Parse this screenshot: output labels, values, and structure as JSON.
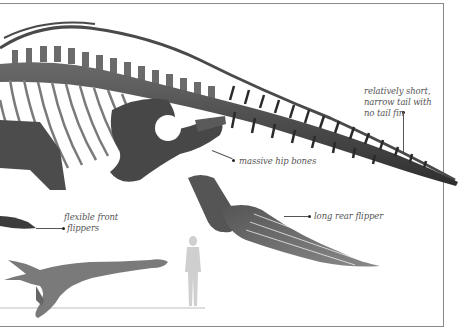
{
  "figure": {
    "colors": {
      "frame": "#8a8a8a",
      "bone_dark": "#3a3a3a",
      "bone_mid": "#5e5e5e",
      "bone_light": "#8c8c8c",
      "silhouette_human": "#cfcfcf",
      "label_text": "#555555"
    }
  },
  "annotations": {
    "tail": {
      "line1": "relatively short,",
      "line2": "narrow tail with",
      "line3": "no tail fin"
    },
    "hip": {
      "text": "massive hip bones"
    },
    "front_flipper": {
      "line1": "flexible front",
      "line2": "flippers"
    },
    "rear_flipper": {
      "text": "long rear flipper"
    }
  },
  "scale_comparison": {
    "reptile": "reconstructed animal silhouette",
    "human": "human silhouette for scale"
  }
}
